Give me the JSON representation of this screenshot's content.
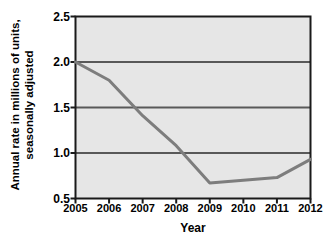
{
  "chart_data": {
    "type": "line",
    "title": "",
    "xlabel": "Year",
    "ylabel_lines": [
      "Annual rate in millions of units,",
      "seasonally adjusted"
    ],
    "ylabel": "Annual rate in millions of units, seasonally adjusted",
    "categories": [
      "2005",
      "2006",
      "2007",
      "2008",
      "2009",
      "2010",
      "2011",
      "2012"
    ],
    "x": [
      2005,
      2006,
      2007,
      2008,
      2009,
      2010,
      2011,
      2012
    ],
    "values": [
      2.0,
      1.8,
      1.41,
      1.08,
      0.67,
      0.7,
      0.73,
      0.93
    ],
    "series": [
      {
        "name": "Annual rate",
        "values": [
          2.0,
          1.8,
          1.41,
          1.08,
          0.67,
          0.7,
          0.73,
          0.93
        ]
      }
    ],
    "ylim": [
      0.5,
      2.5
    ],
    "xlim": [
      2005,
      2012
    ],
    "yticks": [
      0.5,
      1.0,
      1.5,
      2.0,
      2.5
    ],
    "ytick_labels": [
      "0.5",
      "1.0",
      "1.5",
      "2.0",
      "2.5"
    ],
    "gridlines_y": [
      1.0,
      1.5,
      2.0
    ],
    "grid": "horizontal",
    "legend": "none",
    "colors": {
      "line": "#7d7d7d",
      "plot_background": "#e6e6e6",
      "gridline": "#595959",
      "axis": "#1a1a1a",
      "text": "#000000",
      "page_background": "#ffffff"
    }
  }
}
